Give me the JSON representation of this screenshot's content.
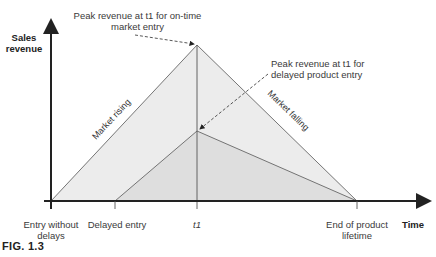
{
  "figure": {
    "caption": "FIG. 1.3",
    "y_axis_label_line1": "Sales",
    "y_axis_label_line2": "revenue",
    "x_axis_label": "Time",
    "annotations": {
      "ontime_peak_line1": "Peak revenue at t1 for on-time",
      "ontime_peak_line2": "market entry",
      "delayed_peak_line1": "Peak revenue at t1 for",
      "delayed_peak_line2": "delayed product entry",
      "market_rising": "Market rising",
      "market_falling": "Market falling"
    },
    "x_ticks": {
      "entry_without_delays_line1": "Entry without",
      "entry_without_delays_line2": "delays",
      "delayed_entry": "Delayed entry",
      "t1": "t1",
      "end_of_lifetime_line1": "End of product",
      "end_of_lifetime_line2": "lifetime"
    },
    "colors": {
      "ontime_fill": "#ececec",
      "delayed_fill": "#dcdcdc",
      "line": "#555555",
      "axis": "#222222"
    }
  }
}
